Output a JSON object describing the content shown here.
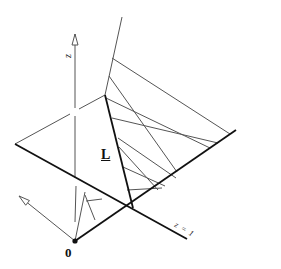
{
  "labels": {
    "z_axis": "z",
    "line_L": "L",
    "origin": "0",
    "z_equals_one": "z = 1"
  },
  "colors": {
    "thin": "#555555",
    "bold": "#111111",
    "background": "#ffffff"
  },
  "geometry": {
    "origin": [
      75,
      241
    ],
    "z_axis": {
      "from": [
        75,
        178
      ],
      "to": [
        75,
        34
      ],
      "gap": [
        [
          75,
          108
        ],
        [
          75,
          116
        ]
      ]
    },
    "left_arrow": {
      "from": [
        75,
        241
      ],
      "to": [
        19,
        196
      ]
    },
    "plane_left_edge": {
      "from": [
        15,
        144
      ],
      "to": [
        105,
        95
      ]
    },
    "plane_front_edge": {
      "from": [
        15,
        144
      ],
      "to": [
        187,
        239
      ]
    },
    "L_segment": {
      "from": [
        105,
        95
      ],
      "to": [
        133,
        208
      ]
    },
    "baseline_right": {
      "from": [
        75,
        241
      ],
      "to": [
        236,
        130
      ]
    },
    "upper_edge": {
      "from": [
        105,
        95
      ],
      "to": [
        122,
        17
      ]
    },
    "fan_lines": [
      {
        "from": [
          112,
          58
        ],
        "to": [
          230,
          134
        ]
      },
      {
        "from": [
          109,
          76
        ],
        "to": [
          177,
          172
        ]
      },
      {
        "from": [
          106,
          98
        ],
        "to": [
          210,
          148
        ]
      },
      {
        "from": [
          112,
          118
        ],
        "to": [
          218,
          143
        ]
      },
      {
        "from": [
          118,
          138
        ],
        "to": [
          176,
          178
        ]
      },
      {
        "from": [
          119,
          147
        ],
        "to": [
          158,
          190
        ]
      },
      {
        "from": [
          123,
          167
        ],
        "to": [
          165,
          186
        ]
      },
      {
        "from": [
          127,
          190
        ],
        "to": [
          162,
          188
        ]
      }
    ],
    "inner_lines": [
      {
        "from": [
          75,
          222
        ],
        "to": [
          76,
          186
        ]
      },
      {
        "from": [
          75,
          241
        ],
        "to": [
          85,
          192
        ]
      },
      {
        "from": [
          95,
          220
        ],
        "to": [
          85,
          195
        ]
      },
      {
        "from": [
          86,
          201
        ],
        "to": [
          102,
          199
        ]
      }
    ]
  }
}
